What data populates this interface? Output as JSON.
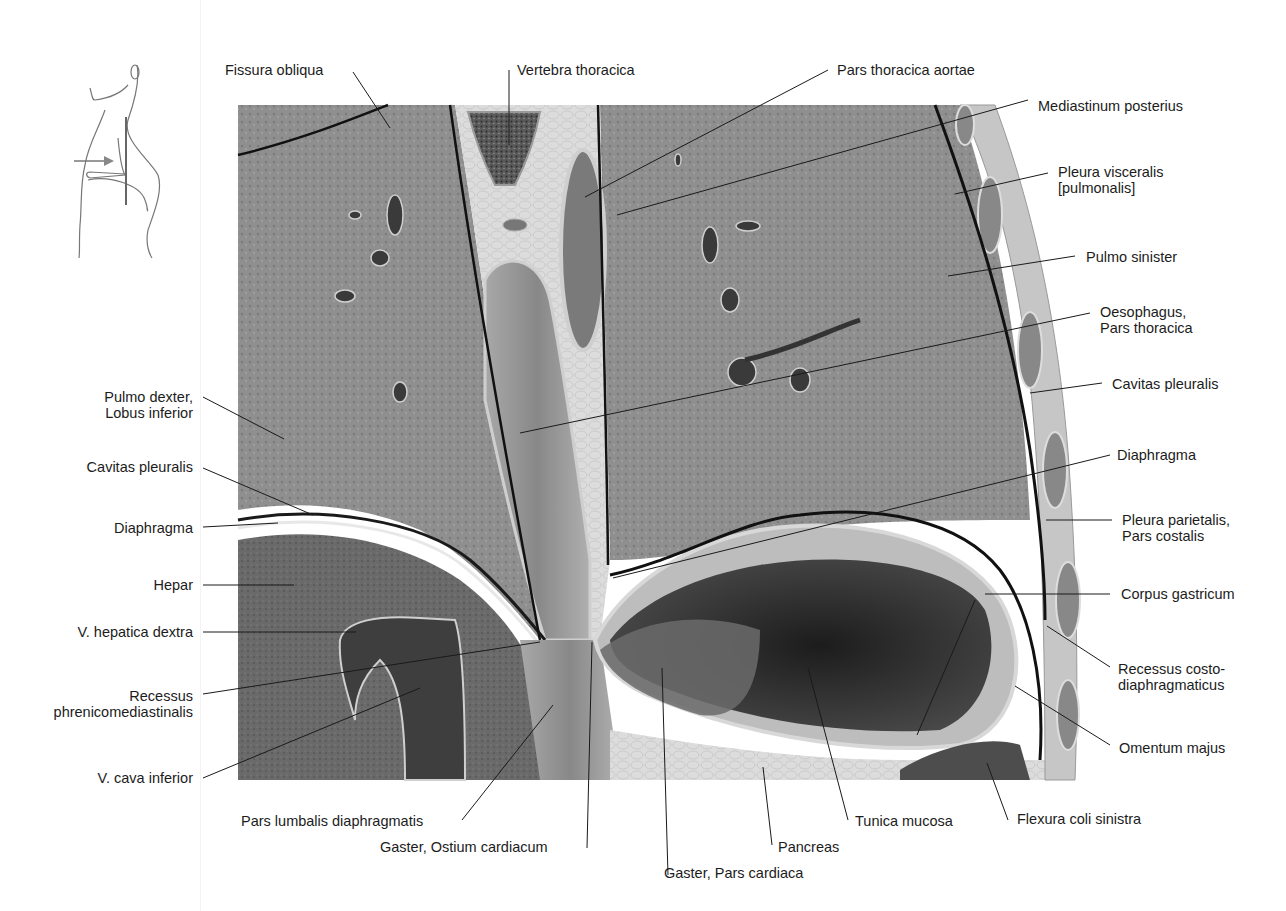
{
  "figure": {
    "orientation_sketch": {
      "icon": "body-outline-sagittal-icon",
      "arrow": "view-direction-arrow"
    },
    "colors": {
      "background": "#ffffff",
      "lung_tissue": "#8e8e8e",
      "lung_tissue_dark": "#6f6f6f",
      "liver": "#666666",
      "connective": "#d9d9d9",
      "muscle": "#9a9a9a",
      "stomach_lumen": "#2a2a2a",
      "leader_line": "#1a1a1a"
    }
  },
  "labels": {
    "top": [
      {
        "id": "fissura-obliqua",
        "text": "Fissura obliqua"
      },
      {
        "id": "vertebra-thoracica",
        "text": "Vertebra thoracica"
      },
      {
        "id": "pars-thoracica-aortae",
        "text": "Pars thoracica aortae"
      }
    ],
    "right": [
      {
        "id": "mediastinum-posterius",
        "text": "Mediastinum posterius"
      },
      {
        "id": "pleura-visceralis",
        "lines": [
          "Pleura visceralis",
          "[pulmonalis]"
        ]
      },
      {
        "id": "pulmo-sinister",
        "text": "Pulmo sinister"
      },
      {
        "id": "oesophagus",
        "lines": [
          "Oesophagus,",
          "Pars thoracica"
        ]
      },
      {
        "id": "cavitas-pleuralis-right",
        "text": "Cavitas pleuralis"
      },
      {
        "id": "diaphragma-right",
        "text": "Diaphragma"
      },
      {
        "id": "pleura-parietalis",
        "lines": [
          "Pleura parietalis,",
          "Pars costalis"
        ]
      },
      {
        "id": "corpus-gastricum",
        "text": "Corpus gastricum"
      },
      {
        "id": "recessus-costodiaphragmaticus",
        "lines": [
          "Recessus costo-",
          "diaphragmaticus"
        ]
      },
      {
        "id": "omentum-majus",
        "text": "Omentum majus"
      }
    ],
    "left": [
      {
        "id": "pulmo-dexter",
        "lines": [
          "Pulmo dexter,",
          "Lobus inferior"
        ]
      },
      {
        "id": "cavitas-pleuralis-left",
        "text": "Cavitas pleuralis"
      },
      {
        "id": "diaphragma-left",
        "text": "Diaphragma"
      },
      {
        "id": "hepar",
        "text": "Hepar"
      },
      {
        "id": "v-hepatica-dextra",
        "text": "V. hepatica dextra"
      },
      {
        "id": "recessus-phrenicomediastinalis",
        "lines": [
          "Recessus",
          "phrenicomediastinalis"
        ]
      },
      {
        "id": "v-cava-inferior",
        "text": "V. cava inferior"
      }
    ],
    "bottom": [
      {
        "id": "pars-lumbalis",
        "text": "Pars lumbalis diaphragmatis"
      },
      {
        "id": "ostium-cardiacum",
        "text": "Gaster, Ostium cardiacum"
      },
      {
        "id": "pars-cardiaca",
        "text": "Gaster, Pars cardiaca"
      },
      {
        "id": "pancreas",
        "text": "Pancreas"
      },
      {
        "id": "tunica-mucosa",
        "text": "Tunica mucosa"
      },
      {
        "id": "flexura-coli-sinistra",
        "text": "Flexura coli sinistra"
      }
    ]
  }
}
